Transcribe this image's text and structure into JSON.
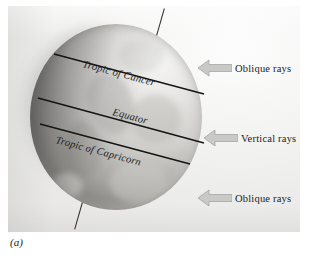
{
  "figure": {
    "caption": "(a)"
  },
  "globe": {
    "latitude_lines": [
      {
        "id": "tropic-of-cancer",
        "label": "Tropic of Cancer"
      },
      {
        "id": "equator",
        "label": "Equator"
      },
      {
        "id": "tropic-of-capricorn",
        "label": "Tropic of Capricorn"
      }
    ],
    "axis": {
      "top_tick": "axis-tick-top",
      "bottom_tick": "axis-tick-bottom"
    }
  },
  "rays": [
    {
      "id": "oblique-top",
      "label": "Oblique rays",
      "icon": "left-arrow-icon"
    },
    {
      "id": "vertical",
      "label": "Vertical rays",
      "icon": "left-arrow-icon"
    },
    {
      "id": "oblique-bottom",
      "label": "Oblique rays",
      "icon": "left-arrow-icon"
    }
  ],
  "colors": {
    "line": "#1a1a1a",
    "arrow_fill": "#c9c9c7",
    "arrow_stroke": "#9d9d9a",
    "text": "#1b1b1b",
    "plate_background": "#efefee"
  }
}
